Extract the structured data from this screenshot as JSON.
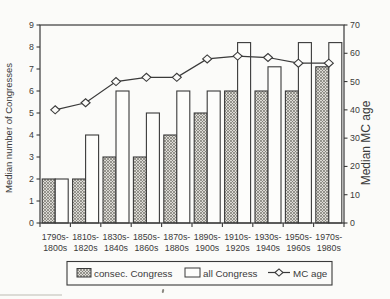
{
  "figure": {
    "colors": {
      "paper": "#fbfbf9",
      "ink": "#3a3a3a",
      "hatch_line": "#77756f",
      "hatch_bg": "#dcdad5",
      "white_bar_fill": "#fdfdfb"
    }
  },
  "chart_data": {
    "type": "bar",
    "overlay": "line",
    "title": "",
    "categories": [
      "1790s-1800s",
      "1810s-1820s",
      "1830s-1840s",
      "1850s-1860s",
      "1870s-1880s",
      "1890s-1900s",
      "1910s-1920s",
      "1930s-1940s",
      "1950s-1960s",
      "1970s-1980s"
    ],
    "series": [
      {
        "name": "consec. Congress",
        "kind": "bar",
        "fill": "hatched",
        "axis": "left",
        "values": [
          2,
          2,
          3,
          3,
          4,
          5,
          6,
          6,
          6,
          7.1
        ]
      },
      {
        "name": "all Congress",
        "kind": "bar",
        "fill": "white",
        "axis": "left",
        "values": [
          2,
          4,
          6,
          5,
          6,
          6,
          8.2,
          7.1,
          8.2,
          8.2
        ]
      },
      {
        "name": "MC age",
        "kind": "line",
        "marker": "diamond",
        "axis": "right",
        "values": [
          40,
          42.5,
          50,
          51.5,
          51.5,
          58,
          59,
          58.5,
          56.5,
          56.5
        ]
      }
    ],
    "left_axis": {
      "label": "Median number of Congresses",
      "min": 0,
      "max": 9,
      "ticks": [
        0,
        1,
        2,
        3,
        4,
        5,
        6,
        7,
        8,
        9
      ]
    },
    "right_axis": {
      "label": "Median MC age",
      "min": 0,
      "max": 70,
      "ticks": [
        0,
        10,
        20,
        30,
        40,
        50,
        60,
        70
      ]
    },
    "legend": {
      "position": "bottom",
      "items": [
        "consec. Congress",
        "all Congress",
        "MC age"
      ]
    },
    "grid": false
  }
}
